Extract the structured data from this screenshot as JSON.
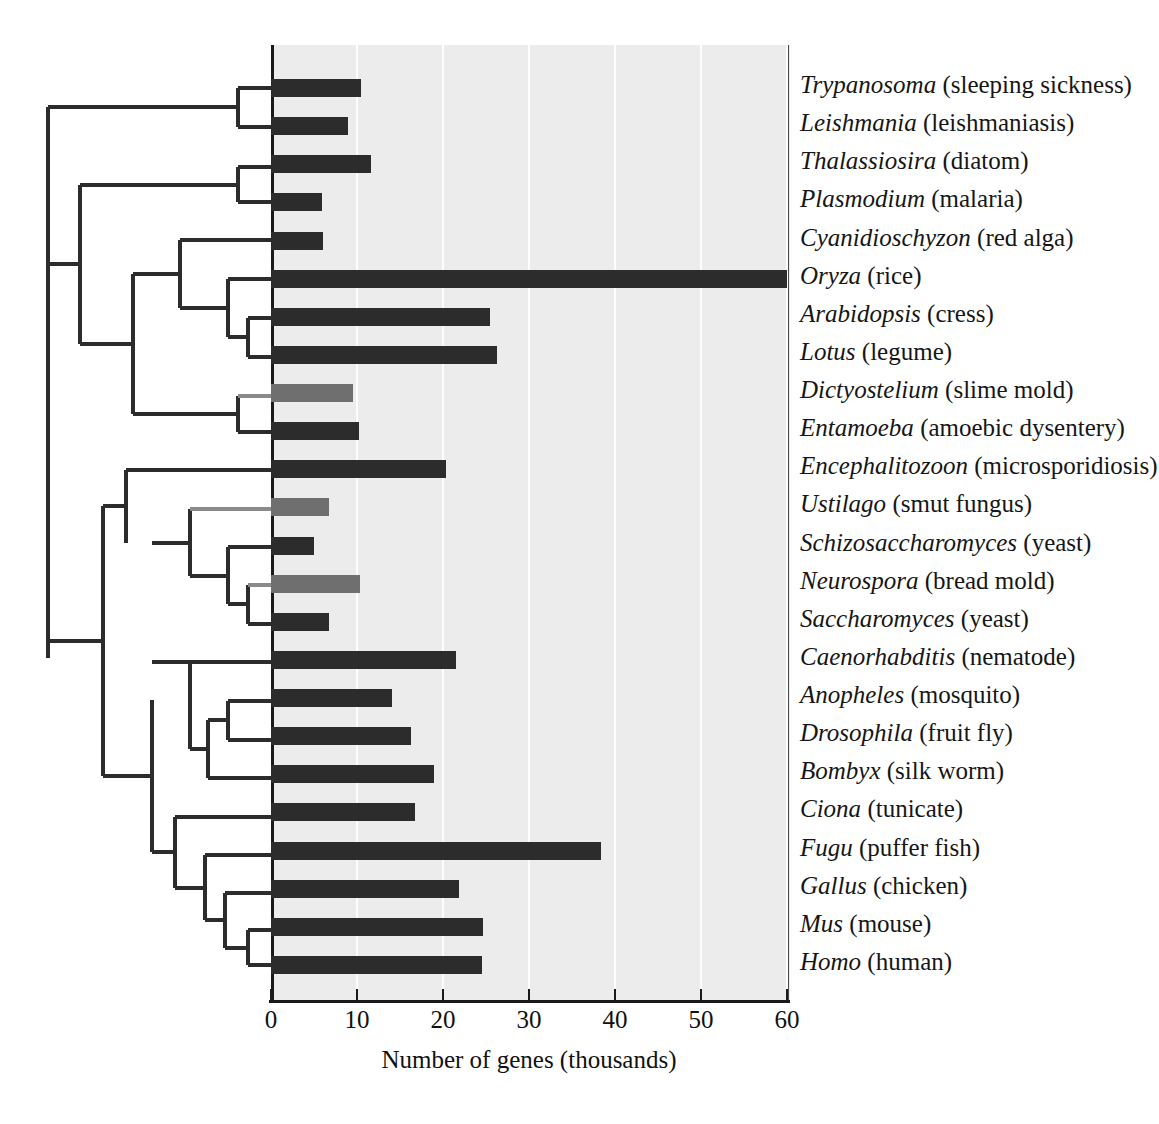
{
  "figure": {
    "axis_title": "Number of genes (thousands)",
    "x_ticks": [
      "0",
      "10",
      "20",
      "30",
      "40",
      "50",
      "60"
    ],
    "colors": {
      "bar_dark": "#2c2c2c",
      "bar_light": "#6f6f6f",
      "plot_background": "#ececec",
      "gridline": "#fdfdfd",
      "axis": "#1a1a1a",
      "tree_dark": "#2c2c2c",
      "tree_light": "#8a8a8a"
    }
  },
  "chart_data": {
    "type": "bar",
    "orientation": "horizontal",
    "title": "",
    "xlabel": "Number of genes (thousands)",
    "ylabel": "",
    "xlim": [
      0,
      60
    ],
    "xticks": [
      0,
      10,
      20,
      30,
      40,
      50,
      60
    ],
    "grid": true,
    "legend": null,
    "units": "thousands of genes",
    "categories": [
      "Trypanosoma (sleeping sickness)",
      "Leishmania (leishmaniasis)",
      "Thalassiosira (diatom)",
      "Plasmodium (malaria)",
      "Cyanidioschyzon (red alga)",
      "Oryza (rice)",
      "Arabidopsis (cress)",
      "Lotus (legume)",
      "Dictyostelium (slime mold)",
      "Entamoeba (amoebic dysentery)",
      "Encephalitozoon (microsporidiosis)",
      "Ustilago (smut fungus)",
      "Schizosaccharomyces (yeast)",
      "Neurospora (bread mold)",
      "Saccharomyces (yeast)",
      "Caenorhabditis (nematode)",
      "Anopheles (mosquito)",
      "Drosophila (fruit fly)",
      "Bombyx (silk worm)",
      "Ciona (tunicate)",
      "Fugu (puffer fish)",
      "Gallus (chicken)",
      "Mus (mouse)",
      "Homo (human)"
    ],
    "values": [
      10.5,
      8.9,
      11.6,
      5.9,
      6.0,
      60.0,
      25.5,
      26.3,
      9.5,
      10.2,
      20.4,
      6.8,
      5.0,
      10.4,
      6.7,
      21.5,
      14.1,
      16.3,
      18.9,
      16.7,
      38.4,
      21.9,
      24.6,
      24.5
    ],
    "bar_shades": [
      "dark",
      "dark",
      "dark",
      "dark",
      "dark",
      "dark",
      "dark",
      "dark",
      "light",
      "dark",
      "dark",
      "light",
      "dark",
      "light",
      "dark",
      "dark",
      "dark",
      "dark",
      "dark",
      "dark",
      "dark",
      "dark",
      "dark",
      "dark"
    ]
  },
  "taxa": [
    {
      "genus": "Trypanosoma",
      "common": "(sleeping sickness)",
      "value": 10.5,
      "shade": "dark"
    },
    {
      "genus": "Leishmania",
      "common": "(leishmaniasis)",
      "value": 8.9,
      "shade": "dark"
    },
    {
      "genus": "Thalassiosira",
      "common": "(diatom)",
      "value": 11.6,
      "shade": "dark"
    },
    {
      "genus": "Plasmodium",
      "common": "(malaria)",
      "value": 5.9,
      "shade": "dark"
    },
    {
      "genus": "Cyanidioschyzon",
      "common": "(red alga)",
      "value": 6.0,
      "shade": "dark"
    },
    {
      "genus": "Oryza",
      "common": "(rice)",
      "value": 60.0,
      "shade": "dark"
    },
    {
      "genus": "Arabidopsis",
      "common": "(cress)",
      "value": 25.5,
      "shade": "dark"
    },
    {
      "genus": "Lotus",
      "common": "(legume)",
      "value": 26.3,
      "shade": "dark"
    },
    {
      "genus": "Dictyostelium",
      "common": "(slime mold)",
      "value": 9.5,
      "shade": "light"
    },
    {
      "genus": "Entamoeba",
      "common": "(amoebic dysentery)",
      "value": 10.2,
      "shade": "dark"
    },
    {
      "genus": "Encephalitozoon",
      "common": "(microsporidiosis)",
      "value": 20.4,
      "shade": "dark"
    },
    {
      "genus": "Ustilago",
      "common": "(smut fungus)",
      "value": 6.8,
      "shade": "light"
    },
    {
      "genus": "Schizosaccharomyces",
      "common": "(yeast)",
      "value": 5.0,
      "shade": "dark"
    },
    {
      "genus": "Neurospora",
      "common": "(bread mold)",
      "value": 10.4,
      "shade": "light"
    },
    {
      "genus": "Saccharomyces",
      "common": "(yeast)",
      "value": 6.7,
      "shade": "dark"
    },
    {
      "genus": "Caenorhabditis",
      "common": "(nematode)",
      "value": 21.5,
      "shade": "dark"
    },
    {
      "genus": "Anopheles",
      "common": "(mosquito)",
      "value": 14.1,
      "shade": "dark"
    },
    {
      "genus": "Drosophila",
      "common": "(fruit fly)",
      "value": 16.3,
      "shade": "dark"
    },
    {
      "genus": "Bombyx",
      "common": "(silk worm)",
      "value": 18.9,
      "shade": "dark"
    },
    {
      "genus": "Ciona",
      "common": "(tunicate)",
      "value": 16.7,
      "shade": "dark"
    },
    {
      "genus": "Fugu",
      "common": "(puffer fish)",
      "value": 38.4,
      "shade": "dark"
    },
    {
      "genus": "Gallus",
      "common": "(chicken)",
      "value": 21.9,
      "shade": "dark"
    },
    {
      "genus": "Mus",
      "common": "(mouse)",
      "value": 24.6,
      "shade": "dark"
    },
    {
      "genus": "Homo",
      "common": "(human)",
      "value": 24.5,
      "shade": "dark"
    }
  ]
}
